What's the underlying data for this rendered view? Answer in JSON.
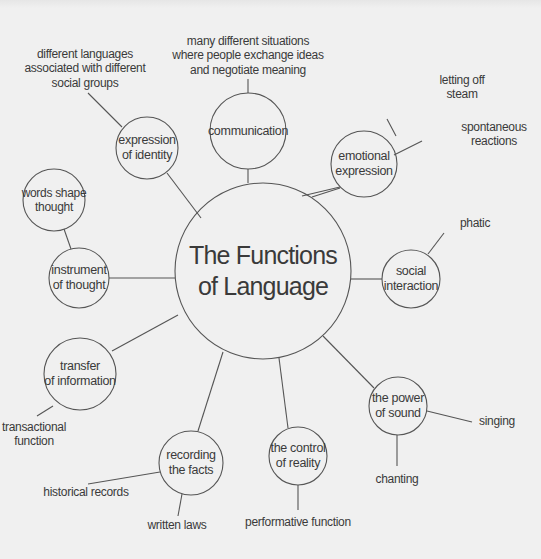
{
  "diagram": {
    "center": {
      "label": "The Functions\nof Language"
    },
    "functions": [
      {
        "id": "communication",
        "label": "communication",
        "examples": [
          "many different situations\nwhere people exchange ideas\nand negotiate meaning"
        ]
      },
      {
        "id": "emotional-expression",
        "label": "emotional\nexpression",
        "examples": [
          "letting off steam",
          "spontaneous\nreactions"
        ]
      },
      {
        "id": "social-interaction",
        "label": "social\ninteraction",
        "examples": [
          "phatic"
        ]
      },
      {
        "id": "power-of-sound",
        "label": "the power\nof sound",
        "examples": [
          "singing",
          "chanting"
        ]
      },
      {
        "id": "control-of-reality",
        "label": "the control\nof reality",
        "examples": [
          "performative function"
        ]
      },
      {
        "id": "recording-facts",
        "label": "recording\nthe facts",
        "examples": [
          "historical records",
          "written laws"
        ]
      },
      {
        "id": "transfer-of-information",
        "label": "transfer\nof information",
        "examples": [
          "transactional\nfunction"
        ]
      },
      {
        "id": "instrument-of-thought",
        "label": "instrument\nof thought",
        "examples": [
          "words shape\nthought"
        ]
      },
      {
        "id": "expression-of-identity",
        "label": "expression\nof identity",
        "examples": [
          "different languages\nassociated with different\nsocial groups"
        ]
      }
    ]
  }
}
